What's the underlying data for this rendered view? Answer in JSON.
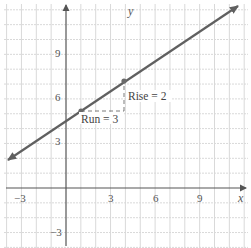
{
  "chart_data": {
    "type": "line",
    "title": "",
    "xlabel": "x",
    "ylabel": "y",
    "xlim": [
      -4,
      12
    ],
    "ylim": [
      -4,
      12
    ],
    "grid": true,
    "x_ticks": [
      -3,
      3,
      6,
      9
    ],
    "y_ticks": [
      9,
      6,
      3,
      -3
    ],
    "x_tick_labels": [
      "−3",
      "3",
      "6",
      "9"
    ],
    "y_tick_labels": [
      "9",
      "6",
      "3",
      "−3"
    ],
    "series": [
      {
        "name": "line",
        "equation": "y = (2/3)x + 13/3",
        "slope": 0.6667,
        "intercept": 4.3333,
        "x": [
          -4,
          11.7
        ],
        "y": [
          1.67,
          12.13
        ],
        "arrows_both_ends": true,
        "color": "#606060"
      }
    ],
    "points": [
      {
        "x": 1,
        "y": 5
      },
      {
        "x": 4,
        "y": 7
      }
    ],
    "annotations": [
      {
        "text": "Run = 3",
        "type": "run",
        "from": [
          1,
          5
        ],
        "to": [
          4,
          5
        ]
      },
      {
        "text": "Rise = 2",
        "type": "rise",
        "from": [
          4,
          5
        ],
        "to": [
          4,
          7
        ]
      }
    ]
  },
  "labels": {
    "x_axis": "x",
    "y_axis": "y",
    "run": "Run = 3",
    "rise": "Rise = 2",
    "xt_neg3": "−3",
    "xt_3": "3",
    "xt_6": "6",
    "xt_9": "9",
    "yt_9": "9",
    "yt_6": "6",
    "yt_3": "3",
    "yt_neg3": "−3"
  },
  "colors": {
    "grid": "#d9d9d9",
    "axis": "#555555",
    "line": "#606060",
    "point": "#6a6a6a",
    "dash": "#7a7a7a"
  }
}
